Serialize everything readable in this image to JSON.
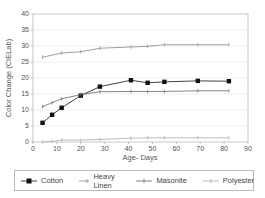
{
  "chart_data": {
    "type": "line",
    "title": "",
    "xlabel": "Age- Days",
    "ylabel": "Color Change (CIELab)",
    "xlim": [
      0,
      90
    ],
    "ylim": [
      0,
      40
    ],
    "x_ticks": [
      0,
      10,
      20,
      30,
      40,
      50,
      60,
      70,
      80,
      90
    ],
    "y_ticks": [
      0,
      5,
      10,
      15,
      20,
      25,
      30,
      35,
      40
    ],
    "grid": "horizontal",
    "legend_position": "bottom",
    "series": [
      {
        "name": "Cotton",
        "color": "#111111",
        "marker": "square",
        "x": [
          4,
          8,
          12,
          20,
          28,
          41,
          48,
          55,
          69,
          82
        ],
        "y": [
          6,
          8.5,
          10.7,
          14.5,
          17.3,
          19.3,
          18.5,
          18.8,
          19.1,
          19.0
        ]
      },
      {
        "name": "Heavy Linen",
        "color": "#888888",
        "marker": "plus",
        "x": [
          4,
          12,
          20,
          28,
          41,
          48,
          55,
          69,
          82
        ],
        "y": [
          26.5,
          27.8,
          28.2,
          29.3,
          29.7,
          29.9,
          30.4,
          30.4,
          30.4
        ]
      },
      {
        "name": "Masonite",
        "color": "#666666",
        "marker": "plus",
        "x": [
          4,
          8,
          12,
          20,
          28,
          41,
          48,
          55,
          69,
          82
        ],
        "y": [
          11,
          12.3,
          13.5,
          14.8,
          15.7,
          15.8,
          15.8,
          15.8,
          16.0,
          16.0
        ]
      },
      {
        "name": "Polyester",
        "color": "#aaaaaa",
        "marker": "plus",
        "x": [
          4,
          8,
          12,
          20,
          28,
          41,
          48,
          55,
          69,
          82
        ],
        "y": [
          0,
          0.2,
          0.6,
          0.6,
          0.8,
          1.2,
          1.3,
          1.3,
          1.3,
          1.3
        ]
      }
    ]
  },
  "legend": {
    "items": [
      "Cotton",
      "Heavy Linen",
      "Masonite",
      "Polyester"
    ]
  }
}
